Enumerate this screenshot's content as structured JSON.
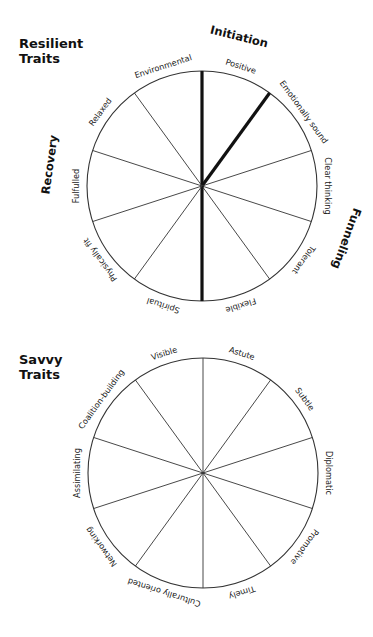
{
  "wheels": [
    {
      "id": "resilient",
      "title_line1": "Resilient",
      "title_line2": "Traits",
      "center": [
        202,
        186
      ],
      "radius": 115,
      "segments": [
        "Positive",
        "Emotionally sound",
        "Clear thinking",
        "Tolerant",
        "Flexible",
        "Spiritual",
        "Physically fit",
        "Fulfulled",
        "Relaxed",
        "Environmental"
      ],
      "highlighted_spokes": [
        0,
        1,
        5
      ],
      "groups": [
        {
          "label": "Initiation",
          "angle": 14,
          "r": 150
        },
        {
          "label": "Funneling",
          "angle": 110,
          "r": 150
        },
        {
          "label": "Recovery",
          "angle": 278,
          "r": 150
        }
      ]
    },
    {
      "id": "savvy",
      "title_line1": "Savvy",
      "title_line2": "Traits",
      "center": [
        203,
        473
      ],
      "radius": 115,
      "segments": [
        "Astute",
        "Subtle",
        "Diplomatic",
        "Promotive",
        "Timely",
        "Culturally oriented",
        "Networking",
        "Assimilating",
        "Coalition-building",
        "Visible"
      ],
      "highlighted_spokes": [],
      "groups": []
    }
  ],
  "colors": {
    "line": "#333333",
    "highlight": "#111111",
    "text": "#1a1a1a"
  }
}
